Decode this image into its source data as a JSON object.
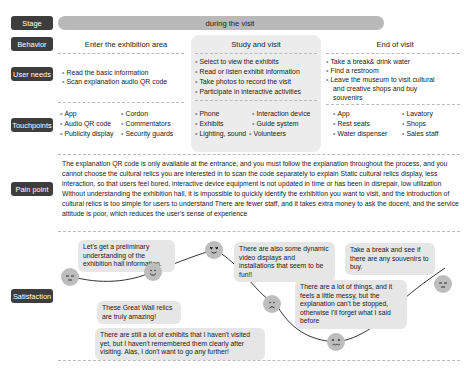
{
  "rows": {
    "stage": "Stage",
    "behavior": "Behavior",
    "user_needs": "User needs",
    "touchpoints": "Touchpoints",
    "pain_point": "Pain point",
    "satisfaction": "Satisfaction"
  },
  "stage": {
    "title": "during the visit"
  },
  "behavior": {
    "col1": "Enter the exhibition area",
    "col2": "Study and visit",
    "col3": "End of visit"
  },
  "user_needs": {
    "col1": [
      "Read the basic information",
      "Scan explanation audio QR code"
    ],
    "col2": [
      "Select to view the exhibits",
      "Read or listen  exhibit information",
      "Take photos to record the visit",
      "Participate in interactive activities"
    ],
    "col3": [
      "Take a break& drink water",
      "Find a restroom",
      "Leave the museum to visit cultural",
      "and creative shops and buy",
      "souvenirs"
    ]
  },
  "touchpoints": {
    "col1": [
      "App",
      "Audio QR code",
      "Publicity display",
      "Cordon",
      "Commentators",
      "Security guards"
    ],
    "col2": [
      "Phone",
      "Exhibits",
      "Lighting, sound",
      "Interaction device",
      "Guide system",
      "Volunteers"
    ],
    "col3": [
      "App",
      "Rest seats",
      "Water dispenser",
      "Lavatory",
      "Shops",
      "Sales staff"
    ]
  },
  "pain_point": {
    "text": "The explanation QR code is only available at the entrance, and you must follow the explanation throughout the process, and you cannot choose the cultural relics you are interested in to scan the code separately to explain Static cultural relics display, less interaction, so that users feel bored, interactive device equipment is not updated in time or has been in disrepair, low utilization Without understanding the exhibition hall, it is impossible to quickly identify the exhibition you want to visit, and the introduction of cultural relics is too simple for users to understand There are fewer staff, and it takes extra money to ask the docent, and the service attitude is poor, which reduces the user's sense of experience"
  },
  "satisfaction": {
    "bubbles": [
      "Let's get a preliminary understanding of the exhibition hall information.",
      "These Great Wall relics are truly amazing!",
      "There are also some dynamic video displays and installations that seem to be fun!!",
      "There are still a lot of exhibits that I haven't visited yet, but I haven't remembered them clearly after visiting. Alas, I don't want to go any further!",
      "There are a lot of things, and it feels a little messy, but the explanation can't be stopped, otherwise I'll forget what I said before",
      "Take a break and see if there are any souvenirs to buy."
    ],
    "faces": [
      "neutral",
      "smile",
      "love",
      "sad",
      "distressed",
      "neutral"
    ]
  },
  "colors": {
    "label_bg": "#3d3d3d",
    "stage_bar": "#b9b9b9",
    "card_bg": "#ececec",
    "bubble_bg": "#e6e6e6",
    "face": "#bdbdbd"
  }
}
